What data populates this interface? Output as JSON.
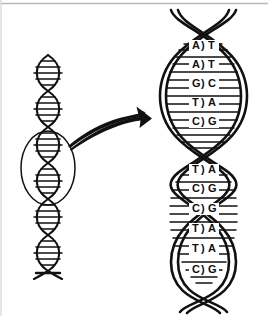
{
  "figure": {
    "background_color": "#ffffff",
    "ink_color": "#111111",
    "frame": {
      "top_rule_color": "#b8b8b8",
      "left_rule_color": "#d8d8d8"
    }
  },
  "small_helix": {
    "name": "whole-dna-molecule",
    "segments": 7,
    "rungs_per_segment": 5,
    "center_x": 48,
    "top_y": 55,
    "bottom_y": 279,
    "width": 30
  },
  "callout": {
    "ellipse_label": "magnified-region",
    "cx": 48,
    "cy": 168,
    "rx": 27,
    "ry": 37,
    "arrow_label": "magnification-arrow",
    "arrow_from": "circled helix region",
    "arrow_to": "enlarged helix"
  },
  "large_helix": {
    "name": "magnified-dna-helix",
    "center_x": 203,
    "top_y": 10,
    "bottom_y": 310,
    "half_width": 38,
    "turns": 2,
    "lenses": [
      {
        "index": 0,
        "top_y": 42,
        "bottom_y": 150,
        "base_pairs": [
          {
            "left": "A",
            "right": "T"
          },
          {
            "left": "A",
            "right": "T"
          },
          {
            "left": "G",
            "right": "C"
          },
          {
            "left": "T",
            "right": "A"
          },
          {
            "left": "C",
            "right": "G"
          }
        ],
        "unlabeled_rungs": 6
      },
      {
        "index": 1,
        "top_y": 166,
        "bottom_y": 282,
        "base_pairs": [
          {
            "left": "T",
            "right": "A"
          },
          {
            "left": "C",
            "right": "G"
          },
          {
            "left": "C",
            "right": "G"
          },
          {
            "left": "T",
            "right": "A"
          },
          {
            "left": "T",
            "right": "A"
          },
          {
            "left": "C",
            "right": "G"
          }
        ],
        "unlabeled_rungs": 6
      }
    ],
    "pair_separator": ")"
  },
  "legend_note": {
    "base_pairing": [
      "A-T",
      "T-A",
      "G-C",
      "C-G"
    ]
  }
}
